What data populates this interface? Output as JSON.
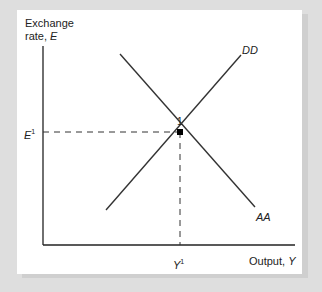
{
  "diagram": {
    "y_axis_label_line1": "Exchange",
    "y_axis_label_line2": "rate, ",
    "y_axis_var": "E",
    "x_axis_label": "Output, ",
    "x_axis_var": "Y",
    "curves": [
      {
        "name": "DD",
        "label": "DD",
        "slope": "upward"
      },
      {
        "name": "AA",
        "label": "AA",
        "slope": "downward"
      }
    ],
    "equilibrium_label": "1",
    "e_tick_var": "E",
    "e_tick_sup": "1",
    "y_tick_var": "Y",
    "y_tick_sup": "1"
  },
  "colors": {
    "background": "#dedede",
    "panel": "#ffffff",
    "line": "#222222"
  }
}
